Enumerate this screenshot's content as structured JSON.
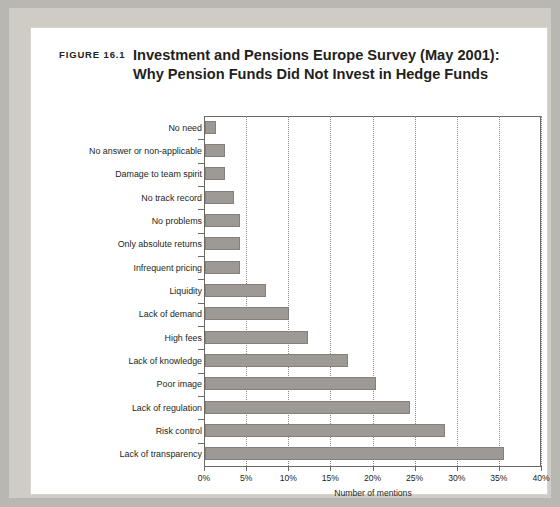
{
  "figure": {
    "label": "FIGURE 16.1",
    "title_line_1": "Investment and Pensions Europe Survey (May 2001):",
    "title_line_2": "Why Pension Funds Did Not Invest in Hedge Funds"
  },
  "axis": {
    "x_title": "Number of mentions",
    "x_ticks": [
      "0%",
      "5%",
      "10%",
      "15%",
      "20%",
      "25%",
      "30%",
      "35%",
      "40%"
    ]
  },
  "colors": {
    "bar_fill": "#9d9a95",
    "bar_stroke": "#84817c",
    "axis": "#6d6a66",
    "grid": "#8c8984",
    "text": "#231f20",
    "page_frame": "#b9b7b2",
    "card": "#ffffff"
  },
  "chart_data": {
    "type": "bar",
    "orientation": "horizontal",
    "xlabel": "Number of mentions",
    "ylabel": "",
    "xlim": [
      0,
      40
    ],
    "x_tick_values": [
      0,
      5,
      10,
      15,
      20,
      25,
      30,
      35,
      40
    ],
    "x_tick_labels": [
      "0%",
      "5%",
      "10%",
      "15%",
      "20%",
      "25%",
      "30%",
      "35%",
      "40%"
    ],
    "grid": "vertical-dotted",
    "legend": "none",
    "categories": [
      "No need",
      "No answer or non-applicable",
      "Damage to team spirit",
      "No track record",
      "No problems",
      "Only absolute returns",
      "Infrequent pricing",
      "Liquidity",
      "Lack of demand",
      "High fees",
      "Lack of knowledge",
      "Poor image",
      "Lack of regulation",
      "Risk control",
      "Lack of transparency"
    ],
    "values": [
      1.3,
      2.4,
      2.4,
      3.5,
      4.2,
      4.2,
      4.2,
      7.2,
      10.0,
      12.2,
      17.0,
      20.3,
      24.3,
      28.5,
      35.5
    ],
    "value_unit": "%"
  }
}
